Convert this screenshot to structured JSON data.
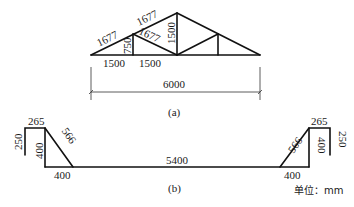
{
  "figure_a": {
    "caption": "(a)",
    "labels": {
      "top_chord_left_lower": "1677",
      "top_chord_left_upper": "1677",
      "web_vertical_left": "750",
      "web_diagonal_left": "1677",
      "king_post": "1500",
      "bottom_seg_1": "1500",
      "bottom_seg_2": "1500",
      "span": "6000"
    }
  },
  "figure_b": {
    "caption": "(b)",
    "labels": {
      "left_lip": "250",
      "left_top": "265",
      "left_diagonal": "566",
      "left_vertical": "400",
      "left_base": "400",
      "middle_base": "5400",
      "right_diagonal": "566",
      "right_top": "265",
      "right_vertical": "400",
      "right_lip": "250",
      "right_base": "400"
    },
    "unit_label": "单位：mm"
  }
}
